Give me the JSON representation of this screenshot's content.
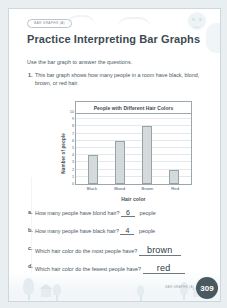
{
  "worksheet": {
    "badge_label": "BAR GRAPHS (A)",
    "title": "Practice Interpreting Bar Graphs",
    "instruction": "Use the bar graph to answer the questions.",
    "question_number": "1.",
    "question_text": "This bar graph shows how many people in a room have black, blond, brown, or red hair.",
    "footer_label": "BAR GRAPHS (A)",
    "page_number": "309"
  },
  "chart_data": {
    "type": "bar",
    "title": "People with Different Hair Colors",
    "categories": [
      "Black",
      "Blond",
      "Brown",
      "Red"
    ],
    "values": [
      4,
      6,
      8,
      2
    ],
    "xlabel": "Hair color",
    "ylabel": "Number of people",
    "ylim": [
      0,
      10
    ],
    "yticks": [
      "10",
      "9",
      "8",
      "7",
      "6",
      "5",
      "4",
      "3",
      "2",
      "1",
      "0"
    ],
    "grid": true,
    "legend": "none",
    "bar_fill": "#d4d9db",
    "bar_stroke": "#98a3a8"
  },
  "answers": [
    {
      "letter": "a.",
      "prompt": "How many people have blond hair?",
      "value": "6",
      "unit": "people",
      "kind": "num"
    },
    {
      "letter": "b.",
      "prompt": "How many people have black hair?",
      "value": "4",
      "unit": "people",
      "kind": "num"
    },
    {
      "letter": "c.",
      "prompt": "Which hair color do the most people have?",
      "value": "brown",
      "unit": "",
      "kind": "word"
    },
    {
      "letter": "d.",
      "prompt": "Which hair color do the fewest people have?",
      "value": "red",
      "unit": "",
      "kind": "word"
    }
  ]
}
